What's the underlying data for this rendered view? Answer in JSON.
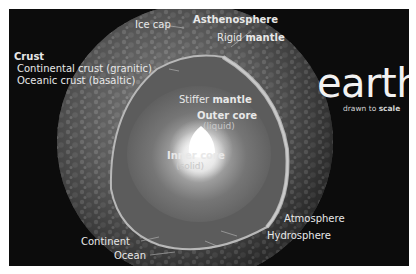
{
  "title": "earth",
  "subtitle": {
    "prefix": "drawn to ",
    "emphasis": "scale"
  },
  "labels": {
    "ice_cap": "Ice cap",
    "asthenosphere": "Asthenosphere",
    "rigid_mantle": {
      "prefix": "Rigid ",
      "emphasis": "mantle"
    },
    "crust": "Crust",
    "continental_crust": "Continental crust (granitic)",
    "oceanic_crust": "Oceanic crust (basaltic)",
    "stiffer_mantle": {
      "prefix": "Stiffer ",
      "emphasis": "mantle"
    },
    "outer_core": {
      "name": "Outer core",
      "state": "(liquid)"
    },
    "inner_core": {
      "name": "Inner core",
      "state": "(solid)"
    },
    "atmosphere": "Atmosphere",
    "hydrosphere": "Hydrosphere",
    "continent": "Continent",
    "ocean": "Ocean"
  },
  "colors": {
    "background": "#0c0c0c",
    "frame": "#ffffff",
    "text": "#e8e8e8",
    "inner_core": "#ffffff",
    "mantle": "#5a5a5a"
  }
}
